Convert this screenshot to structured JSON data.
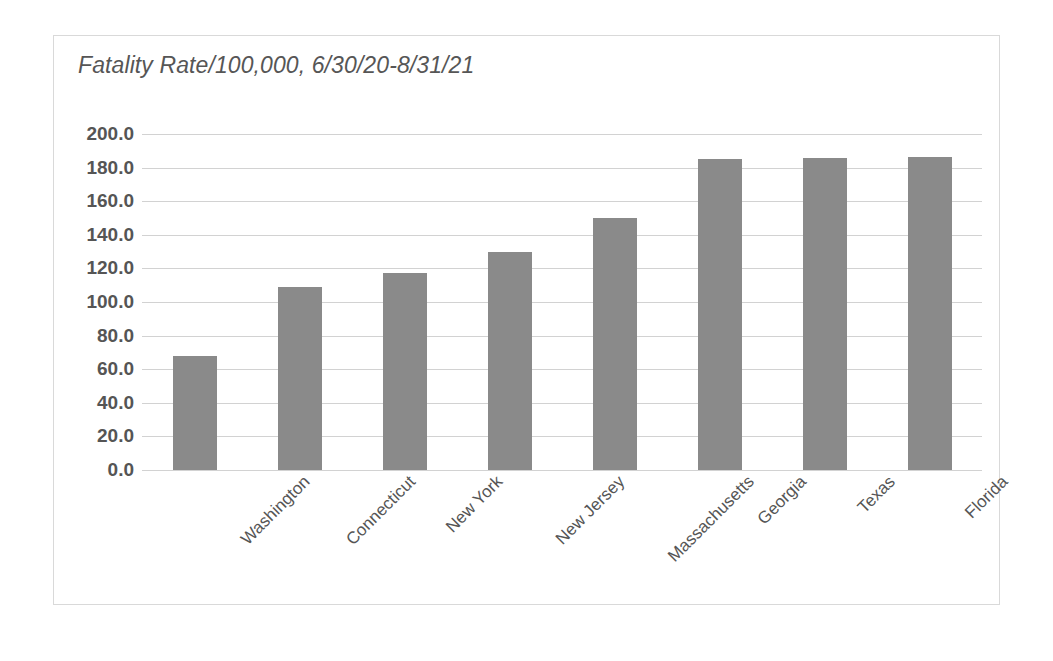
{
  "chart_data": {
    "type": "bar",
    "title": "Fatality Rate/100,000, 6/30/20-8/31/21",
    "xlabel": "",
    "ylabel": "",
    "categories": [
      "Washington",
      "Connecticut",
      "New York",
      "New Jersey",
      "Massachusetts",
      "Georgia",
      "Texas",
      "Florida"
    ],
    "values": [
      68.0,
      109.0,
      117.0,
      130.0,
      150.0,
      185.0,
      186.0,
      186.5
    ],
    "ylim": [
      0.0,
      200.0
    ],
    "ytick_labels": [
      "200.0",
      "180.0",
      "160.0",
      "140.0",
      "120.0",
      "100.0",
      "80.0",
      "60.0",
      "40.0",
      "20.0",
      "0.0"
    ],
    "ytick_values": [
      200.0,
      180.0,
      160.0,
      140.0,
      120.0,
      100.0,
      80.0,
      60.0,
      40.0,
      20.0,
      0.0
    ],
    "grid": true,
    "legend": false,
    "bar_color": "#8a8a8a",
    "gridline_color": "#d2d2d2",
    "title_color": "#565656",
    "label_color": "#555555",
    "frame_color": "#d9d9d9",
    "x_label_rotation_deg": -45
  }
}
